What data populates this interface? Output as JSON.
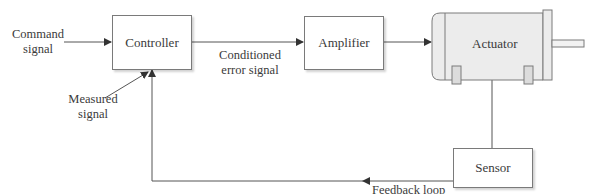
{
  "diagram": {
    "type": "closed-loop control block diagram",
    "blocks": [
      {
        "id": "controller",
        "label": "Controller"
      },
      {
        "id": "amplifier",
        "label": "Amplifier"
      },
      {
        "id": "actuator",
        "label": "Actuator"
      },
      {
        "id": "sensor",
        "label": "Sensor"
      }
    ],
    "labels": {
      "command_signal_line1": "Command",
      "command_signal_line2": "signal",
      "conditioned_line1": "Conditioned",
      "conditioned_line2": "error signal",
      "measured_line1": "Measured",
      "measured_line2": "signal",
      "feedback_loop": "Feedback loop"
    },
    "edges": [
      {
        "from": "command signal",
        "to": "controller"
      },
      {
        "from": "controller",
        "to": "amplifier",
        "label": "Conditioned error signal"
      },
      {
        "from": "amplifier",
        "to": "actuator"
      },
      {
        "from": "actuator",
        "to": "sensor"
      },
      {
        "from": "sensor",
        "to": "controller",
        "label": "Feedback loop"
      },
      {
        "from": "measured signal",
        "to": "controller"
      }
    ],
    "colors": {
      "line": "#555555",
      "box_border": "#7a7a7a",
      "motor_fill": "#eeeeee"
    }
  }
}
